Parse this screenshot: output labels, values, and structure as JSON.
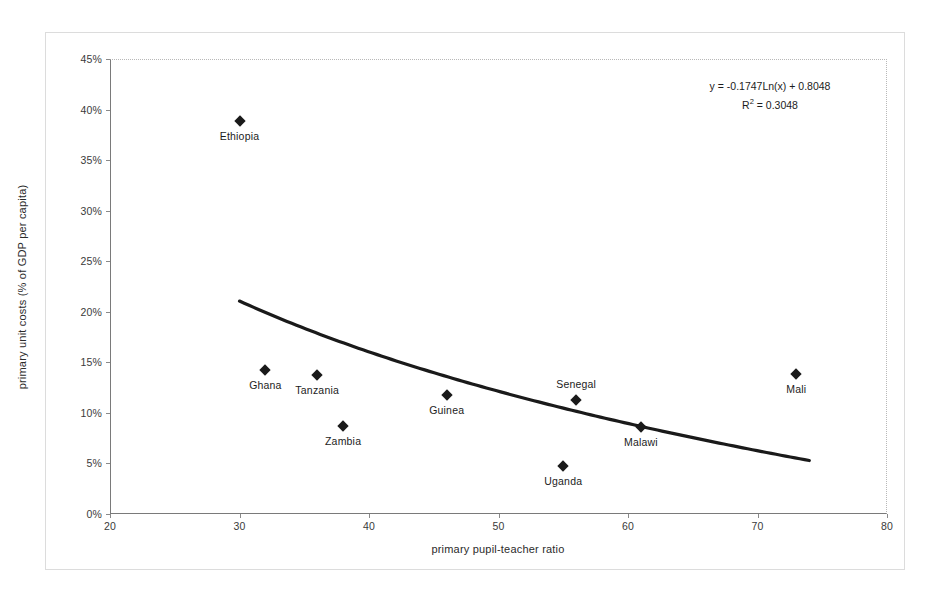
{
  "chart_data": {
    "type": "scatter",
    "title": "",
    "xlabel": "primary pupil-teacher ratio",
    "ylabel": "primary unit costs (% of GDP per capita)",
    "xlim": [
      20,
      80
    ],
    "ylim": [
      0,
      45
    ],
    "xticks": [
      "20",
      "30",
      "40",
      "50",
      "60",
      "70",
      "80"
    ],
    "xtick_values": [
      20,
      30,
      40,
      50,
      60,
      70,
      80
    ],
    "yticks": [
      "0%",
      "5%",
      "10%",
      "15%",
      "20%",
      "25%",
      "30%",
      "35%",
      "40%",
      "45%"
    ],
    "ytick_values": [
      0,
      5,
      10,
      15,
      20,
      25,
      30,
      35,
      40,
      45
    ],
    "grid": false,
    "legend": "none",
    "marker_color": "#1a1a1a",
    "marker_shape": "diamond",
    "trendline_color": "#1a1a1a",
    "points": [
      {
        "label": "Ethiopia",
        "x": 30,
        "y": 38.9,
        "label_position": "below"
      },
      {
        "label": "Ghana",
        "x": 32,
        "y": 14.2,
        "label_position": "below"
      },
      {
        "label": "Tanzania",
        "x": 36,
        "y": 13.7,
        "label_position": "below"
      },
      {
        "label": "Zambia",
        "x": 38,
        "y": 8.7,
        "label_position": "below"
      },
      {
        "label": "Guinea",
        "x": 46,
        "y": 11.8,
        "label_position": "below"
      },
      {
        "label": "Uganda",
        "x": 55,
        "y": 4.7,
        "label_position": "below"
      },
      {
        "label": "Senegal",
        "x": 56,
        "y": 11.3,
        "label_position": "above"
      },
      {
        "label": "Malawi",
        "x": 61,
        "y": 8.6,
        "label_position": "below"
      },
      {
        "label": "Mali",
        "x": 73,
        "y": 13.8,
        "label_position": "below"
      }
    ],
    "trendline": {
      "type": "logarithmic",
      "equation": "y = -0.1747Ln(x) + 0.8048",
      "r_squared_label": "R",
      "r_squared_exponent": "2",
      "r_squared_value": "= 0.3048",
      "r_squared_full": "R2 = 0.3048",
      "slope_coefficient": -0.1747,
      "intercept": 0.8048,
      "r_squared": 0.3048,
      "x_start": 30,
      "x_end": 74
    }
  }
}
